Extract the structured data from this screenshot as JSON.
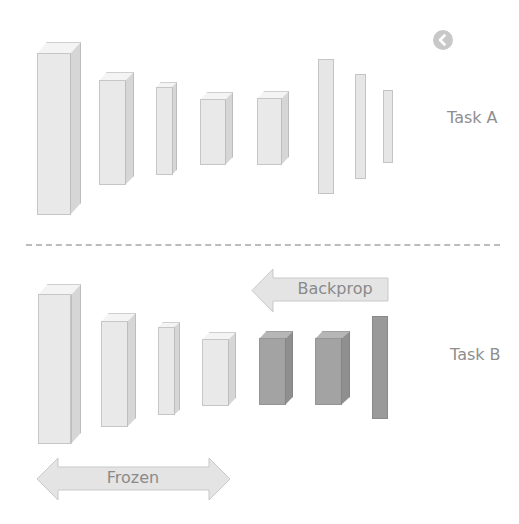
{
  "diagram": {
    "type": "transfer-learning-schematic",
    "colors": {
      "frozen_block": "#e9e9e9",
      "trainable_block": "#a3a3a3",
      "text": "#8e8e8e",
      "divider": "#bcbcbc",
      "arrow_fill": "#e4e4e4"
    },
    "badge": {
      "icon": "back-chevron-circle-icon"
    },
    "task_a": {
      "label": "Task A",
      "layers": [
        {
          "kind": "block3d",
          "shade": "light"
        },
        {
          "kind": "block3d",
          "shade": "light"
        },
        {
          "kind": "block3d",
          "shade": "light"
        },
        {
          "kind": "block3d",
          "shade": "light"
        },
        {
          "kind": "block3d",
          "shade": "light"
        },
        {
          "kind": "flat",
          "shade": "light"
        },
        {
          "kind": "flat",
          "shade": "light"
        },
        {
          "kind": "flat",
          "shade": "light"
        }
      ]
    },
    "divider": {
      "style": "dashed"
    },
    "task_b": {
      "label": "Task B",
      "layers": [
        {
          "kind": "block3d",
          "shade": "light",
          "state": "frozen"
        },
        {
          "kind": "block3d",
          "shade": "light",
          "state": "frozen"
        },
        {
          "kind": "block3d",
          "shade": "light",
          "state": "frozen"
        },
        {
          "kind": "block3d",
          "shade": "light",
          "state": "frozen"
        },
        {
          "kind": "block3d",
          "shade": "dark",
          "state": "trainable"
        },
        {
          "kind": "block3d",
          "shade": "dark",
          "state": "trainable"
        },
        {
          "kind": "flat",
          "shade": "dark",
          "state": "trainable"
        }
      ],
      "backprop_arrow": {
        "label": "Backprop",
        "direction": "left"
      },
      "frozen_arrow": {
        "label": "Frozen",
        "direction": "both"
      }
    }
  }
}
